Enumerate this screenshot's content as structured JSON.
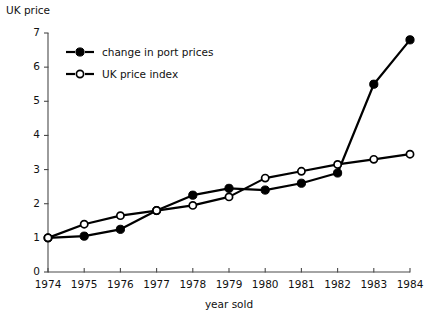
{
  "chart_data": {
    "type": "line",
    "title": "",
    "xlabel": "year sold",
    "ylabel": "UK price",
    "x": [
      1974,
      1975,
      1976,
      1977,
      1978,
      1979,
      1980,
      1981,
      1982,
      1983,
      1984
    ],
    "categories": [
      "1974",
      "1975",
      "1976",
      "1977",
      "1978",
      "1979",
      "1980",
      "1981",
      "1982",
      "1983",
      "1984"
    ],
    "xlim": [
      1974,
      1984
    ],
    "ylim": [
      0,
      7
    ],
    "yticks": [
      0,
      1,
      2,
      3,
      4,
      5,
      6,
      7
    ],
    "yticklabels": [
      "0",
      "1",
      "2",
      "3",
      "4",
      "5",
      "6",
      "7"
    ],
    "xticklabels": [
      "1974",
      "1975",
      "1976",
      "1977",
      "1978",
      "1979",
      "1980",
      "1981",
      "1982",
      "1983",
      "1984"
    ],
    "grid": false,
    "legend_position": "upper left inside",
    "series": [
      {
        "name": "change in port prices",
        "marker": "filled-circle",
        "color": "#000000",
        "values": [
          1.0,
          1.05,
          1.25,
          1.8,
          2.25,
          2.45,
          2.4,
          2.6,
          2.9,
          5.5,
          6.8
        ]
      },
      {
        "name": "UK price index",
        "marker": "open-circle",
        "color": "#000000",
        "values": [
          1.0,
          1.4,
          1.65,
          1.8,
          1.95,
          2.2,
          2.75,
          2.95,
          3.15,
          3.3,
          3.45
        ]
      }
    ]
  },
  "axes": {
    "y_axis_label": "UK price",
    "x_axis_label": "year sold"
  },
  "legend": {
    "entries": [
      {
        "label": "change in port prices",
        "marker": "filled-circle"
      },
      {
        "label": "UK price index",
        "marker": "open-circle"
      }
    ]
  }
}
